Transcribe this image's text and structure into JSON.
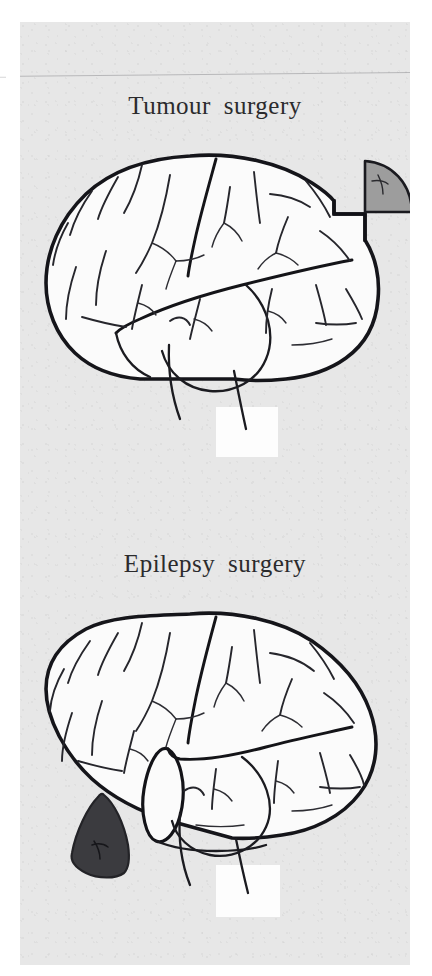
{
  "figure": {
    "background_color": "#e7e7e7",
    "ink_color": "#15151a",
    "page_background": "#ffffff"
  },
  "panels": [
    {
      "id": "tumour-surgery",
      "title": "Tumour  surgery",
      "brain": {
        "view": "left lateral view of cerebral hemisphere",
        "orientation": "frontal lobe to the right, occipital lobe to the left",
        "resection": {
          "type": "lesionectomy notch",
          "location": "posterior superior convexity",
          "shape": "right-angled step cut into the cortical surface"
        }
      },
      "specimen": {
        "label_semantic": "excised-tumour-specimen",
        "shape": "quarter-circle wedge",
        "fill_color": "#9d9d9d",
        "outline_color": "#1a1a1f",
        "position": "upper right, separated from the brain"
      }
    },
    {
      "id": "epilepsy-surgery",
      "title": "Epilepsy  surgery",
      "brain": {
        "view": "left lateral view of cerebral hemisphere",
        "orientation": "frontal lobe to the right, occipital lobe to the left",
        "resection": {
          "type": "anterior temporal lobectomy",
          "location": "anterior temporal pole",
          "shape": "elliptical cut face exposed where the temporal pole was removed"
        }
      },
      "specimen": {
        "label_semantic": "excised-temporal-lobe-specimen",
        "shape": "rounded triangular block",
        "fill_color": "#3b3b3f",
        "outline_color": "#232327",
        "position": "lower left, below and in front of the brain"
      }
    }
  ]
}
